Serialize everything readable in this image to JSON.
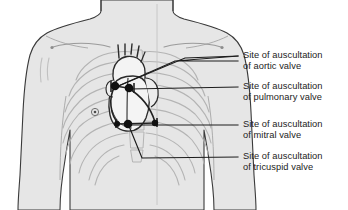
{
  "figure": {
    "colors": {
      "background": "#ffffff",
      "body_fill": "#e6e6e6",
      "body_outline": "#3a3a3a",
      "skeleton": "#b4b4b4",
      "heart_outline": "#2b2b2b",
      "heart_fill": "#f2f2f2",
      "marker": "#111111",
      "leader_line": "#1c1c1c",
      "midline": "#c0c0c0",
      "text": "#1c1c1c"
    }
  },
  "anatomy": {
    "torso_label": "anterior-thorax",
    "skeleton_label": "ribcage-and-sternum",
    "heart_label": "heart",
    "midline_label": "midsternal-line"
  },
  "callouts": [
    {
      "id": "aortic",
      "line1": "Site of auscultation",
      "line2": "of aortic valve",
      "marker_x": 115,
      "marker_y": 86,
      "leader_end_x": 238,
      "leader_end_y": 56
    },
    {
      "id": "pulmonary",
      "line1": "Site of auscultation",
      "line2": "of pulmonary valve",
      "marker_x": 128,
      "marker_y": 88,
      "leader_end_x": 238,
      "leader_end_y": 87
    },
    {
      "id": "mitral",
      "line1": "Site of auscultation",
      "line2": "of mitral valve",
      "marker_x": 127,
      "marker_y": 124,
      "leader_end_x": 238,
      "leader_end_y": 125
    },
    {
      "id": "tricuspid",
      "line1": "Site of auscultation",
      "line2": "of tricuspid valve",
      "marker_x": 127,
      "marker_y": 124,
      "leader_end_x": 238,
      "leader_end_y": 157
    }
  ]
}
